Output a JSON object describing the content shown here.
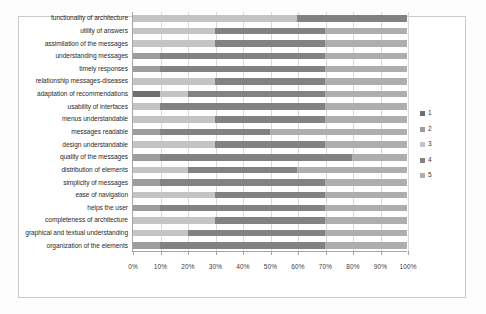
{
  "chart_data": {
    "type": "bar",
    "subtype": "100% stacked horizontal bar",
    "title": "",
    "xlabel": "",
    "ylabel": "",
    "xlim": [
      0,
      100
    ],
    "x_tick_labels": [
      "0%",
      "10%",
      "20%",
      "30%",
      "40%",
      "50%",
      "60%",
      "70%",
      "80%",
      "90%",
      "100%"
    ],
    "x_tick_values": [
      0,
      10,
      20,
      30,
      40,
      50,
      60,
      70,
      80,
      90,
      100
    ],
    "grid": true,
    "legend_position": "right",
    "series": [
      {
        "name": "1",
        "color": "#6f6f6f"
      },
      {
        "name": "2",
        "color": "#9d9d9d"
      },
      {
        "name": "3",
        "color": "#c4c4c4"
      },
      {
        "name": "4",
        "color": "#828282"
      },
      {
        "name": "5",
        "color": "#aeaeae"
      }
    ],
    "categories": [
      "functionality of architecture",
      "utility of answers",
      "assimilation of the messages",
      "understanding messages",
      "timely responses",
      "relationship messages-diseases",
      "adaptation of recommendations",
      "usability of interfaces",
      "menus understandable",
      "messages readable",
      "design understandable",
      "quality of the messages",
      "distribution of elements",
      "simplicity of messages",
      "ease of navigation",
      "helps the user",
      "completeness of architecture",
      "graphical and textual understanding",
      "organization of the elements"
    ],
    "values": [
      [
        0,
        0,
        60,
        40,
        0
      ],
      [
        0,
        0,
        30,
        40,
        30
      ],
      [
        0,
        0,
        30,
        40,
        30
      ],
      [
        0,
        10,
        0,
        60,
        30
      ],
      [
        0,
        10,
        0,
        60,
        30
      ],
      [
        0,
        0,
        30,
        40,
        30
      ],
      [
        10,
        0,
        10,
        50,
        30
      ],
      [
        0,
        0,
        10,
        60,
        30
      ],
      [
        0,
        0,
        30,
        40,
        30
      ],
      [
        0,
        10,
        0,
        40,
        50
      ],
      [
        0,
        0,
        30,
        40,
        30
      ],
      [
        0,
        10,
        0,
        70,
        20
      ],
      [
        0,
        0,
        20,
        40,
        40
      ],
      [
        0,
        10,
        0,
        60,
        30
      ],
      [
        0,
        0,
        30,
        40,
        30
      ],
      [
        0,
        10,
        0,
        60,
        30
      ],
      [
        0,
        0,
        30,
        40,
        30
      ],
      [
        0,
        0,
        20,
        50,
        30
      ],
      [
        0,
        10,
        0,
        60,
        30
      ]
    ]
  }
}
